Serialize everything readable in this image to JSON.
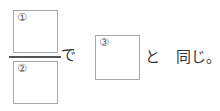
{
  "expression": {
    "numerator_box": {
      "label": "①"
    },
    "denominator_box": {
      "label": "②"
    },
    "particle_de": "で",
    "result_box": {
      "label": "③"
    },
    "particle_to": "と",
    "suffix": "同じ。"
  }
}
